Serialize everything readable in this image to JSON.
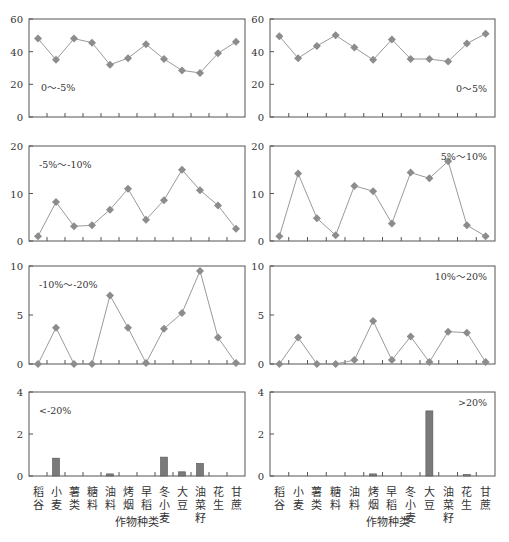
{
  "chart_data": {
    "type": "line",
    "categories": [
      "稻谷",
      "小麦",
      "薯类",
      "糖料",
      "油料",
      "烤烟",
      "早稻",
      "冬小麦",
      "大豆",
      "油菜籽",
      "花生",
      "甘蔗"
    ],
    "category_labels_vertical": [
      [
        "稻",
        "谷"
      ],
      [
        "小",
        "麦"
      ],
      [
        "薯",
        "类"
      ],
      [
        "糖",
        "料"
      ],
      [
        "油",
        "料"
      ],
      [
        "烤",
        "烟"
      ],
      [
        "早",
        "稻"
      ],
      [
        "冬",
        "小",
        "麦"
      ],
      [
        "大",
        "豆"
      ],
      [
        "油",
        "菜",
        "籽"
      ],
      [
        "花",
        "生"
      ],
      [
        "甘",
        "蔗"
      ]
    ],
    "xlabel": "作物种类",
    "panels": [
      {
        "id": "left-1",
        "label": "0～-5%",
        "type": "line",
        "ylim": [
          0,
          60
        ],
        "yticks": [
          0,
          20,
          40,
          60
        ],
        "label_pos": "left-bottom",
        "values": [
          48,
          35,
          48,
          45.5,
          32,
          36,
          44.5,
          35.5,
          28.5,
          27,
          39,
          46
        ]
      },
      {
        "id": "right-1",
        "label": "0～5%",
        "type": "line",
        "ylim": [
          0,
          60
        ],
        "yticks": [
          0,
          20,
          40,
          60
        ],
        "label_pos": "right-bottom",
        "values": [
          49.5,
          36,
          43.5,
          50,
          42.5,
          35,
          47.5,
          35.5,
          35.5,
          34,
          45,
          51
        ]
      },
      {
        "id": "left-2",
        "label": "-5%～-10%",
        "type": "line",
        "ylim": [
          0,
          20
        ],
        "yticks": [
          0,
          10,
          20
        ],
        "label_pos": "left-top",
        "values": [
          1,
          8.2,
          3.1,
          3.3,
          6.6,
          11,
          4.5,
          8.6,
          15,
          10.7,
          7.5,
          2.6
        ]
      },
      {
        "id": "right-2",
        "label": "5%～10%",
        "type": "line",
        "ylim": [
          0,
          20
        ],
        "yticks": [
          0,
          10,
          20
        ],
        "label_pos": "right-top",
        "values": [
          1,
          14.2,
          4.8,
          1.2,
          11.6,
          10.5,
          3.7,
          14.4,
          13.2,
          16.8,
          3.3,
          1
        ]
      },
      {
        "id": "left-3",
        "label": "-10%～-20%",
        "type": "line",
        "ylim": [
          0,
          10
        ],
        "yticks": [
          0,
          5,
          10
        ],
        "label_pos": "left-top",
        "values": [
          0,
          3.7,
          0,
          0,
          7,
          3.7,
          0.1,
          3.6,
          5.2,
          9.5,
          2.7,
          0.1
        ]
      },
      {
        "id": "right-3",
        "label": "10%～20%",
        "type": "line",
        "ylim": [
          0,
          10
        ],
        "yticks": [
          0,
          5,
          10
        ],
        "label_pos": "right-top",
        "values": [
          0,
          2.7,
          0,
          0,
          0.4,
          4.4,
          0.4,
          2.8,
          0.2,
          3.3,
          3.2,
          0.2
        ]
      },
      {
        "id": "left-4",
        "label": "<-20%",
        "type": "bar",
        "ylim": [
          0,
          4
        ],
        "yticks": [
          0,
          2,
          4
        ],
        "label_pos": "left-top",
        "values": [
          0,
          0.85,
          0,
          0,
          0.1,
          0,
          0,
          0.9,
          0.2,
          0.6,
          0,
          0
        ]
      },
      {
        "id": "right-4",
        "label": ">20%",
        "type": "bar",
        "ylim": [
          0,
          4
        ],
        "yticks": [
          0,
          2,
          4
        ],
        "label_pos": "right-top",
        "values": [
          0,
          0,
          0,
          0,
          0,
          0.1,
          0,
          0,
          3.1,
          0,
          0.05,
          0
        ]
      }
    ],
    "style": {
      "line_color": "#9a9a9a",
      "marker_color": "#8c8c8c",
      "bar_color": "#7a7a7a",
      "frame_color": "#555555"
    },
    "grid": false,
    "legend": "none"
  }
}
